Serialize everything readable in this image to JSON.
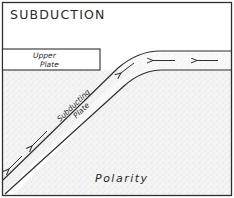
{
  "diagram": {
    "title": "SUBDUCTION",
    "upper_plate_label_line1": "Upper",
    "upper_plate_label_line2": "Plate",
    "subducting_plate_label_line1": "Subducting",
    "subducting_plate_label_line2": "Plate",
    "caption": "Polarity",
    "arrows": [
      {
        "name": "horizontal-arrow-1",
        "direction": "left"
      },
      {
        "name": "horizontal-arrow-2",
        "direction": "left"
      },
      {
        "name": "diagonal-arrow-1",
        "direction": "down-left"
      },
      {
        "name": "diagonal-arrow-2",
        "direction": "down-left"
      }
    ],
    "colors": {
      "line": "#2f2f2f",
      "background": "#ffffff",
      "stipple": "#e6e6e6"
    }
  }
}
